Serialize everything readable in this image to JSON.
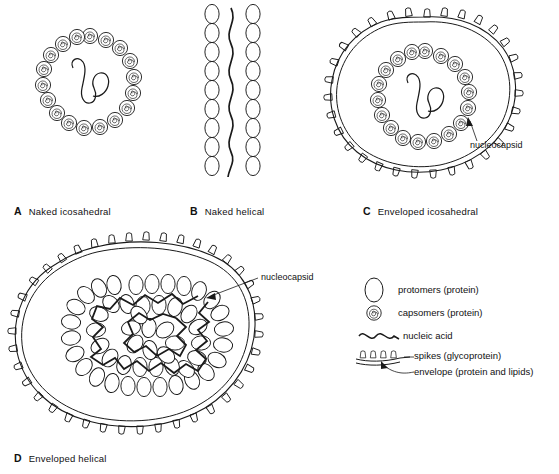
{
  "figure": {
    "type": "diagram",
    "background_color": "#ffffff",
    "line_color": "#1a1a1a"
  },
  "panels": [
    {
      "letter": "A",
      "label": "Naked icosahedral",
      "structure": "hexagonal ring of capsomers enclosing nucleic acid",
      "has_envelope": false,
      "has_spikes": false,
      "capsomer_count": 18,
      "symmetry": "icosahedral"
    },
    {
      "letter": "B",
      "label": "Naked helical",
      "structure": "two vertical columns of stacked protomers flanking a wavy nucleic acid strand",
      "has_envelope": false,
      "has_spikes": false,
      "protomer_rows": 15,
      "symmetry": "helical"
    },
    {
      "letter": "C",
      "label": "Enveloped icosahedral",
      "structure": "spiked envelope surrounding an icosahedral nucleocapsid",
      "has_envelope": true,
      "has_spikes": true,
      "capsomer_count": 18,
      "symmetry": "icosahedral",
      "callout": "nucleocapsid"
    },
    {
      "letter": "D",
      "label": "Enveloped helical",
      "structure": "spiked envelope surrounding a coiled helical nucleocapsid of protomers",
      "has_envelope": true,
      "has_spikes": true,
      "symmetry": "helical",
      "callout": "nucleocapsid"
    }
  ],
  "callouts": {
    "panel_c": "nucleocapsid",
    "panel_d": "nucleocapsid"
  },
  "legend": {
    "items": [
      {
        "icon": "ellipse-icon",
        "label": "protomers (protein)"
      },
      {
        "icon": "spiral-icon",
        "label": "capsomers (protein)"
      },
      {
        "icon": "wavy-line-icon",
        "label": "nucleic acid"
      },
      {
        "icon": "spikes-icon",
        "label": "spikes (glycoprotein)"
      },
      {
        "icon": "membrane-icon",
        "label": "envelope (protein and lipids)"
      }
    ]
  }
}
